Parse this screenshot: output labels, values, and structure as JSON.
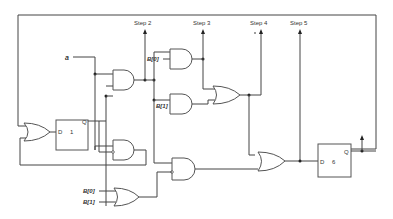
{
  "diagram": {
    "type": "sequential logic circuit (one-hot controller)",
    "input_a": "a",
    "steps": {
      "step2": "Step 2",
      "step3": "Step 3",
      "step4": "Step 4",
      "step5": "Step 5"
    },
    "flipflops": {
      "ff1": {
        "d_label": "D",
        "q_label": "Q",
        "name": "1"
      },
      "ff6": {
        "d_label": "D",
        "q_label": "Q",
        "name": "6"
      }
    },
    "bus_inputs": {
      "b0_upper": "B[0]",
      "b1_upper": "B[1]",
      "b0_lower": "B[0]",
      "b1_lower": "B[1]"
    }
  }
}
